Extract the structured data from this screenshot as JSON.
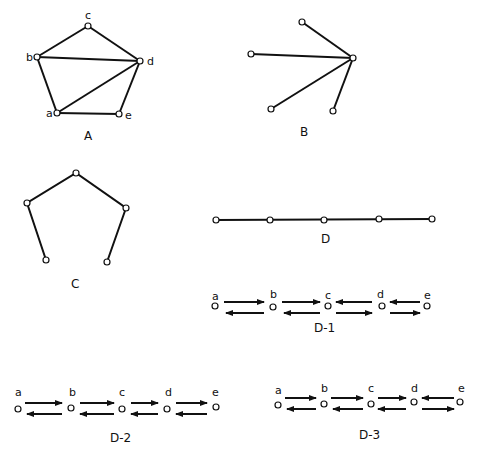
{
  "figure": {
    "graphs": [
      {
        "id": "A",
        "caption": "A",
        "nodes": [
          {
            "id": "a",
            "label": "a",
            "x": 57,
            "y": 113
          },
          {
            "id": "b",
            "label": "b",
            "x": 37,
            "y": 57
          },
          {
            "id": "c",
            "label": "c",
            "x": 88,
            "y": 26
          },
          {
            "id": "d",
            "label": "d",
            "x": 140,
            "y": 61
          },
          {
            "id": "e",
            "label": "e",
            "x": 119,
            "y": 114
          }
        ],
        "edges": [
          [
            "a",
            "b"
          ],
          [
            "b",
            "c"
          ],
          [
            "c",
            "d"
          ],
          [
            "b",
            "d"
          ],
          [
            "a",
            "d"
          ],
          [
            "d",
            "e"
          ],
          [
            "a",
            "e"
          ]
        ]
      },
      {
        "id": "B",
        "caption": "B",
        "edges_count": 4,
        "description": "star graph, one hub connected to four leaves"
      },
      {
        "id": "C",
        "caption": "C",
        "edges_count": 4,
        "description": "path of five nodes drawn as an open pentagon"
      },
      {
        "id": "D",
        "caption": "D",
        "edges_count": 4,
        "description": "path of five nodes in a straight line"
      },
      {
        "id": "D-1",
        "caption": "D-1",
        "node_labels": [
          "a",
          "b",
          "c",
          "d",
          "e"
        ],
        "top_arrows": [
          "a→b",
          "b→c",
          "d→c",
          "e→d"
        ],
        "bottom_arrows": [
          "b→a",
          "c→b",
          "c→d",
          "d→e"
        ]
      },
      {
        "id": "D-2",
        "caption": "D-2",
        "node_labels": [
          "a",
          "b",
          "c",
          "d",
          "e"
        ],
        "top_arrows": [
          "a→b",
          "b→c",
          "c→d",
          "d→e"
        ],
        "bottom_arrows": [
          "b→a",
          "c→b",
          "d→c",
          "e→d"
        ]
      },
      {
        "id": "D-3",
        "caption": "D-3",
        "node_labels": [
          "a",
          "b",
          "c",
          "d",
          "e"
        ],
        "top_arrows": [
          "a→b",
          "b→c",
          "c→d",
          "e→d"
        ],
        "bottom_arrows": [
          "b→a",
          "c→b",
          "d→c",
          "d→e"
        ]
      }
    ],
    "colors": {
      "ink": "#111111",
      "background": "#ffffff"
    }
  }
}
